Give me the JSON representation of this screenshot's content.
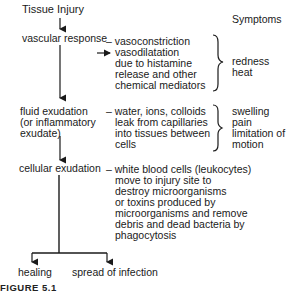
{
  "diagram": {
    "start": "Tissue Injury",
    "symptoms_header": "Symptoms",
    "stages": [
      {
        "label": [
          "vascular response"
        ],
        "description": [
          "– vasoconstriction",
          "vasodilatation",
          "due to histamine",
          "release and other",
          "chemical mediators"
        ],
        "symptoms": [
          "redness",
          "heat"
        ]
      },
      {
        "label": [
          "fluid exudation",
          "(or inflammatory",
          "exudate)"
        ],
        "description": [
          "– water, ions, colloids",
          "leak from capillaries",
          "into tissues between",
          "cells"
        ],
        "symptoms": [
          "swelling",
          "pain",
          "limitation of",
          "motion"
        ]
      },
      {
        "label": [
          "cellular exudation"
        ],
        "description": [
          "– white blood cells (leukocytes)",
          "move to injury site to",
          "destroy microorganisms",
          "or toxins produced by",
          "microorganisms and remove",
          "debris and dead bacteria by",
          "phagocytosis"
        ]
      }
    ],
    "outcomes": [
      "healing",
      "spread of infection"
    ],
    "caption": "FIGURE 5.1"
  }
}
